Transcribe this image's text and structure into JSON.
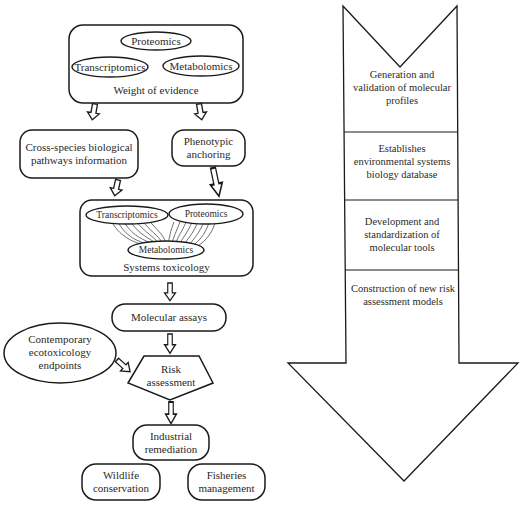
{
  "diagram": {
    "left_flow": {
      "weight_of_evidence": {
        "ellipses": [
          "Proteomics",
          "Transcriptomics",
          "Metabolomics"
        ],
        "label": "Weight of evidence"
      },
      "cross_species": "Cross-species biological pathways information",
      "phenotypic": "Phenotypic anchoring",
      "systems_toxicology": {
        "ellipses": [
          "Transcriptomics",
          "Proteomics",
          "Metabolomics"
        ],
        "label": "Systems toxicology"
      },
      "molecular_assays": "Molecular assays",
      "contemporary": "Contemporary ecotoxicology endpoints",
      "risk_assessment": "Risk assessment",
      "industrial_remediation": "Industrial remediation",
      "wildlife_conservation": "Wildlife conservation",
      "fisheries_management": "Fisheries management"
    },
    "right_arrow": {
      "stages": [
        "Generation and validation of molecular profiles",
        "Establishes environmental systems biology database",
        "Development and standardization of molecular tools",
        "Construction of new risk assessment models"
      ]
    },
    "colors": {
      "stroke": "#1a1a1a",
      "fill": "#ffffff",
      "text": "#2a2a2a"
    }
  }
}
